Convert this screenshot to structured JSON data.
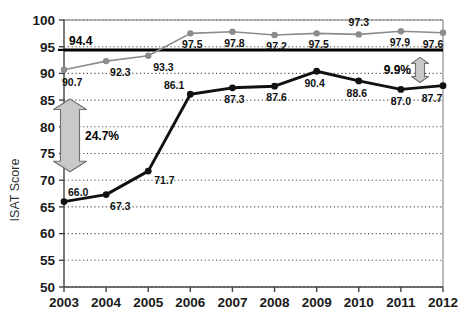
{
  "chart_data": {
    "type": "line",
    "title": "",
    "xlabel": "",
    "ylabel": "ISAT Score",
    "categories": [
      "2003",
      "2004",
      "2005",
      "2006",
      "2007",
      "2008",
      "2009",
      "2010",
      "2011",
      "2012"
    ],
    "x": [
      2003,
      2004,
      2005,
      2006,
      2007,
      2008,
      2009,
      2010,
      2011,
      2012
    ],
    "ylim": [
      50,
      100
    ],
    "yticks": [
      "50",
      "55",
      "60",
      "65",
      "70",
      "75",
      "80",
      "85",
      "90",
      "95",
      "100"
    ],
    "ytick_values": [
      50,
      55,
      60,
      65,
      70,
      75,
      80,
      85,
      90,
      95,
      100
    ],
    "grid": "horizontal-dotted",
    "legend": "none",
    "series": [
      {
        "name": "dark-series",
        "color": "#111111",
        "values": [
          66.0,
          67.3,
          71.7,
          86.1,
          87.3,
          87.6,
          90.4,
          88.6,
          87.0,
          87.7
        ],
        "labels": [
          "66.0",
          "67.3",
          "71.7",
          "86.1",
          "87.3",
          "87.6",
          "90.4",
          "88.6",
          "87.0",
          "87.7"
        ]
      },
      {
        "name": "grey-series",
        "color": "#8c8c8c",
        "values": [
          90.7,
          92.3,
          93.3,
          97.5,
          97.8,
          97.2,
          97.5,
          97.3,
          97.9,
          97.6
        ],
        "labels": [
          "90.7",
          "92.3",
          "93.3",
          "97.5",
          "97.8",
          "97.2",
          "97.5",
          "97.3",
          "97.9",
          "97.6"
        ]
      }
    ],
    "reference_line": {
      "value": 94.4,
      "label": "94.4",
      "color": "#000000"
    },
    "annotations": [
      {
        "name": "gap-left",
        "label": "24.7%",
        "span_from": 66.0,
        "span_to": 90.7
      },
      {
        "name": "gap-right",
        "label": "9.9%",
        "span_from": 87.7,
        "span_to": 97.6
      }
    ]
  }
}
